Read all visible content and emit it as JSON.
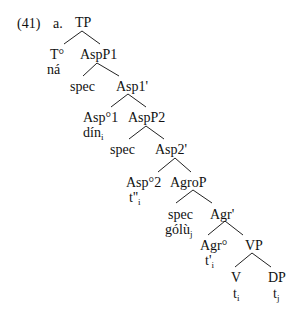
{
  "example": {
    "number": "(41)",
    "letter": "a."
  },
  "tree": {
    "nodes": [
      {
        "id": "TP",
        "label": "TP",
        "sub": "",
        "x": 75,
        "y": 16
      },
      {
        "id": "T0",
        "label": "T°",
        "sub": "",
        "x": 50,
        "y": 48
      },
      {
        "id": "T0-lex",
        "label": "ná",
        "sub": "",
        "x": 47,
        "y": 63
      },
      {
        "id": "AspP1",
        "label": "AspP1",
        "sub": "",
        "x": 80,
        "y": 48
      },
      {
        "id": "spec1",
        "label": "spec",
        "sub": "",
        "x": 70,
        "y": 80
      },
      {
        "id": "Asp1bar",
        "label": "Asp1'",
        "sub": "",
        "x": 116,
        "y": 80
      },
      {
        "id": "Asp01",
        "label": "Asp°1",
        "sub": "",
        "x": 83,
        "y": 111
      },
      {
        "id": "Asp01-lex",
        "label": "dín",
        "sub": "i",
        "x": 83,
        "y": 126
      },
      {
        "id": "AspP2",
        "label": "AspP2",
        "sub": "",
        "x": 128,
        "y": 111
      },
      {
        "id": "spec2",
        "label": "spec",
        "sub": "",
        "x": 110,
        "y": 143
      },
      {
        "id": "Asp2bar",
        "label": "Asp2'",
        "sub": "",
        "x": 155,
        "y": 143
      },
      {
        "id": "Asp02",
        "label": "Asp°2",
        "sub": "",
        "x": 126,
        "y": 176
      },
      {
        "id": "Asp02-trace",
        "label": "t''",
        "sub": "i",
        "x": 129,
        "y": 191
      },
      {
        "id": "AgroP",
        "label": "AgroP",
        "sub": "",
        "x": 170,
        "y": 176
      },
      {
        "id": "spec3",
        "label": "spec",
        "sub": "",
        "x": 168,
        "y": 208
      },
      {
        "id": "spec3-lex",
        "label": "gólù",
        "sub": "j",
        "x": 165,
        "y": 223
      },
      {
        "id": "Agrbar",
        "label": "Agr'",
        "sub": "",
        "x": 210,
        "y": 208
      },
      {
        "id": "Agr0",
        "label": "Agr°",
        "sub": "",
        "x": 200,
        "y": 239
      },
      {
        "id": "Agr0-trace",
        "label": "t'",
        "sub": "i",
        "x": 205,
        "y": 254
      },
      {
        "id": "VP",
        "label": "VP",
        "sub": "",
        "x": 245,
        "y": 239
      },
      {
        "id": "V",
        "label": "V",
        "sub": "",
        "x": 231,
        "y": 271
      },
      {
        "id": "V-trace",
        "label": "t",
        "sub": "i",
        "x": 233,
        "y": 287
      },
      {
        "id": "DP",
        "label": "DP",
        "sub": "",
        "x": 268,
        "y": 271
      },
      {
        "id": "DP-trace",
        "label": "t",
        "sub": "j",
        "x": 273,
        "y": 287
      }
    ],
    "edges": [
      {
        "from": "TP",
        "to": "T0",
        "x1": 82,
        "y1": 31,
        "x2": 64,
        "y2": 44
      },
      {
        "from": "TP",
        "to": "AspP1",
        "x1": 82,
        "y1": 31,
        "x2": 100,
        "y2": 44
      },
      {
        "from": "AspP1",
        "to": "spec1",
        "x1": 97,
        "y1": 63,
        "x2": 83,
        "y2": 76
      },
      {
        "from": "AspP1",
        "to": "Asp1bar",
        "x1": 97,
        "y1": 63,
        "x2": 119,
        "y2": 76
      },
      {
        "from": "Asp1bar",
        "to": "Asp01",
        "x1": 128,
        "y1": 94,
        "x2": 111,
        "y2": 107
      },
      {
        "from": "Asp1bar",
        "to": "AspP2",
        "x1": 128,
        "y1": 94,
        "x2": 146,
        "y2": 107
      },
      {
        "from": "AspP2",
        "to": "spec2",
        "x1": 146,
        "y1": 126,
        "x2": 129,
        "y2": 139
      },
      {
        "from": "AspP2",
        "to": "Asp2bar",
        "x1": 146,
        "y1": 126,
        "x2": 164,
        "y2": 139
      },
      {
        "from": "Asp2bar",
        "to": "Asp02",
        "x1": 175,
        "y1": 158,
        "x2": 158,
        "y2": 172
      },
      {
        "from": "Asp2bar",
        "to": "AgroP",
        "x1": 175,
        "y1": 158,
        "x2": 191,
        "y2": 172
      },
      {
        "from": "AgroP",
        "to": "spec3",
        "x1": 193,
        "y1": 190,
        "x2": 176,
        "y2": 203
      },
      {
        "from": "AgroP",
        "to": "Agrbar",
        "x1": 193,
        "y1": 190,
        "x2": 212,
        "y2": 203
      },
      {
        "from": "Agrbar",
        "to": "Agr0",
        "x1": 225,
        "y1": 221,
        "x2": 208,
        "y2": 235
      },
      {
        "from": "Agrbar",
        "to": "VP",
        "x1": 225,
        "y1": 221,
        "x2": 243,
        "y2": 235
      },
      {
        "from": "VP",
        "to": "V",
        "x1": 252,
        "y1": 253,
        "x2": 235,
        "y2": 267
      },
      {
        "from": "VP",
        "to": "DP",
        "x1": 252,
        "y1": 253,
        "x2": 271,
        "y2": 267
      }
    ]
  }
}
